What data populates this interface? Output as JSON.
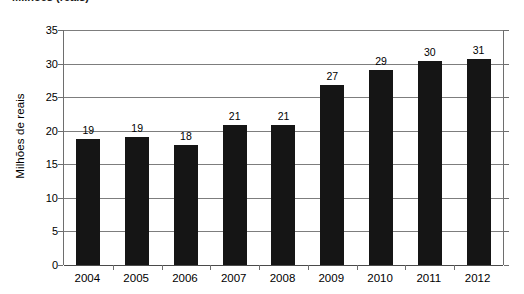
{
  "chart_data": {
    "type": "bar",
    "title": "Milhões (reais)",
    "subtitle": "",
    "xlabel": "",
    "ylabel": "Milhões de reais",
    "categories": [
      "2004",
      "2005",
      "2006",
      "2007",
      "2008",
      "2009",
      "2010",
      "2011",
      "2012"
    ],
    "values": [
      18.7,
      19.0,
      17.9,
      20.8,
      20.8,
      26.8,
      29.0,
      30.4,
      30.7
    ],
    "data_labels": [
      "19",
      "19",
      "18",
      "21",
      "21",
      "27",
      "29",
      "30",
      "31"
    ],
    "ylim": [
      0,
      35
    ],
    "ytick_step": 5,
    "ytick_labels": [
      "0",
      "5",
      "10",
      "15",
      "20",
      "25",
      "30",
      "35"
    ],
    "grid": "horizontal",
    "legend": "none",
    "series": [
      {
        "name": "Milhões de reais",
        "values": [
          18.7,
          19.0,
          17.9,
          20.8,
          20.8,
          26.8,
          29.0,
          30.4,
          30.7
        ]
      }
    ]
  },
  "style": {
    "bar_color": "#151515",
    "gridline_color": "#7d7d7d",
    "axis_color": "#6e6e6e",
    "background": "#ffffff",
    "text_color": "#000000"
  }
}
